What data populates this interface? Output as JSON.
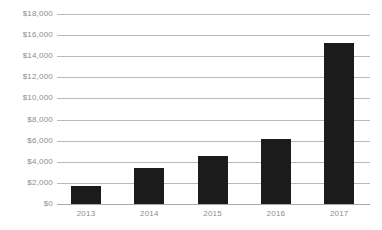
{
  "chart_data": {
    "type": "bar",
    "title": "",
    "subtitle": "",
    "xlabel": "",
    "ylabel": "",
    "categories": [
      "2013",
      "2014",
      "2015",
      "2016",
      "2017"
    ],
    "values": [
      1750,
      3400,
      4550,
      6200,
      15300
    ],
    "ylim": [
      0,
      18000
    ],
    "ytick_values": [
      0,
      2000,
      4000,
      6000,
      8000,
      10000,
      12000,
      14000,
      16000,
      18000
    ],
    "ytick_labels": [
      "$0",
      "$2,000",
      "$4,000",
      "$6,000",
      "$8,000",
      "$10,000",
      "$12,000",
      "$14,000",
      "$16,000",
      "$18,000"
    ],
    "grid": true,
    "legend": false,
    "legend_position": "none",
    "series": [
      {
        "name": "",
        "values": [
          1750,
          3400,
          4550,
          6200,
          15300
        ]
      }
    ],
    "colors": {
      "bar": "#1b1b1b",
      "gridline": "#b9b9b9",
      "baseline": "#a9a9a9",
      "tick_label": "#8d8d8d",
      "background": "#ffffff"
    }
  }
}
